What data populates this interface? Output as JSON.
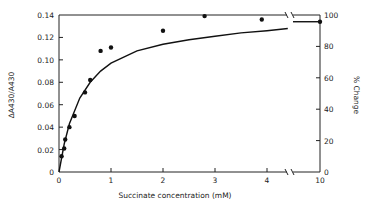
{
  "chart_data": {
    "type": "scatter",
    "title": "",
    "xlabel": "Succinate concentration (mM)",
    "ylabel": "ΔA430/A430",
    "y2label": "% Change",
    "xlim": [
      0,
      10
    ],
    "x_axis_break": [
      4.4,
      9.9
    ],
    "ylim": [
      0,
      0.14
    ],
    "y2lim": [
      0,
      100
    ],
    "x_ticks": [
      "0",
      "1",
      "2",
      "3",
      "4",
      "10"
    ],
    "y_ticks": [
      "0",
      "0.02",
      "0.04",
      "0.06",
      "0.08",
      "0.10",
      "0.12",
      "0.14"
    ],
    "y2_ticks": [
      "0",
      "20",
      "40",
      "60",
      "80",
      "100"
    ],
    "grid": false,
    "legend": null,
    "series": [
      {
        "name": "measured",
        "style": "points",
        "x": [
          0.05,
          0.1,
          0.12,
          0.2,
          0.3,
          0.5,
          0.6,
          0.8,
          1.0,
          2.0,
          2.8,
          3.9,
          10
        ],
        "y": [
          0.014,
          0.021,
          0.029,
          0.04,
          0.05,
          0.071,
          0.082,
          0.108,
          0.111,
          0.126,
          0.139,
          0.136,
          0.134
        ]
      },
      {
        "name": "fitted hyperbola",
        "style": "line",
        "x": [
          0,
          0.1,
          0.2,
          0.4,
          0.6,
          0.8,
          1.0,
          1.5,
          2.0,
          2.5,
          3.0,
          3.5,
          4.0,
          4.4,
          10
        ],
        "y": [
          0,
          0.025,
          0.043,
          0.066,
          0.08,
          0.09,
          0.097,
          0.108,
          0.114,
          0.118,
          0.121,
          0.124,
          0.126,
          0.128,
          0.134
        ]
      }
    ]
  }
}
